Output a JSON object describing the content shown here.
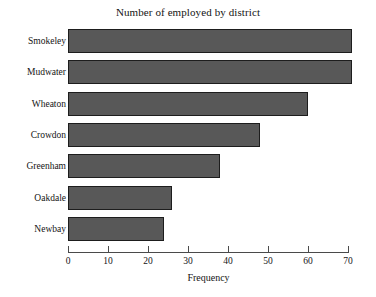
{
  "chart_data": {
    "type": "bar",
    "orientation": "horizontal",
    "title": "Number of employed by district",
    "xlabel": "Frequency",
    "ylabel": "",
    "categories": [
      "Smokeley",
      "Mudwater",
      "Wheaton",
      "Crowdon",
      "Greenham",
      "Oakdale",
      "Newbay"
    ],
    "values": [
      71,
      71,
      60,
      48,
      38,
      26,
      24
    ],
    "xlim": [
      0,
      70
    ],
    "xticks": [
      0,
      10,
      20,
      30,
      40,
      50,
      60,
      70
    ],
    "xtick_labels": [
      "0",
      "10",
      "20",
      "30",
      "40",
      "50",
      "60",
      "70"
    ],
    "grid": false,
    "legend": false,
    "bar_color": "#585858",
    "bar_edge_color": "#1d1d1d",
    "axis_color": "#4a4a4a",
    "background_color": "#ffffff"
  }
}
